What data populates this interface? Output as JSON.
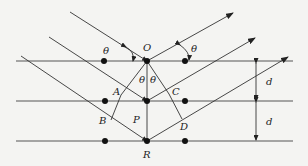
{
  "diagram": {
    "labels": {
      "O": "O",
      "P": "P",
      "R": "R",
      "A": "A",
      "B": "B",
      "C": "C",
      "D": "D",
      "theta_left": "θ",
      "theta_right": "θ",
      "theta_center_left": "θ",
      "theta_center_right": "θ",
      "d_upper": "d",
      "d_lower": "d"
    },
    "planes": [
      {
        "y": 61,
        "atoms_x": [
          104,
          147,
          185
        ]
      },
      {
        "y": 101,
        "atoms_x": [
          105,
          147,
          185
        ]
      },
      {
        "y": 141,
        "atoms_x": [
          105,
          147,
          185
        ]
      }
    ],
    "incident_rays": [
      {
        "from": [
          70,
          12
        ],
        "to": [
          147,
          61
        ]
      },
      {
        "from": [
          49,
          37
        ],
        "to": [
          147,
          101
        ]
      },
      {
        "from": [
          21,
          56
        ],
        "to": [
          147,
          141
        ]
      }
    ],
    "reflected_rays": [
      {
        "from": [
          147,
          61
        ],
        "to": [
          233,
          13
        ]
      },
      {
        "from": [
          147,
          101
        ],
        "to": [
          255,
          38
        ]
      },
      {
        "from": [
          147,
          141
        ],
        "to": [
          288,
          57
        ]
      }
    ],
    "colors": {
      "line": "#333333",
      "plane": "#555555",
      "atom": "#111111",
      "background": "#f4f4f2"
    }
  }
}
